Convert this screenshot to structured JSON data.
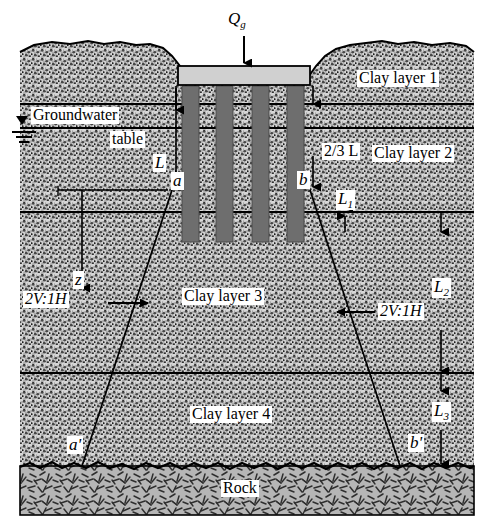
{
  "figure": {
    "width": 493,
    "height": 527
  },
  "colors": {
    "soil_fill": "#d6d6d6",
    "soil_stipple": "#1a1a1a",
    "rock_fill": "#b4b4b4",
    "rock_hatch": "#333333",
    "pile_fill": "#6e6e6e",
    "pile_cap_fill": "#d0d0d0",
    "line": "#000000",
    "label_bg": "#ffffff"
  },
  "load": {
    "symbol": "Q",
    "subscript": "g",
    "arrow": "down-arrow-icon"
  },
  "layers": [
    {
      "id": "clay1",
      "label": "Clay layer 1"
    },
    {
      "id": "clay2",
      "label": "Clay layer 2"
    },
    {
      "id": "clay3",
      "label": "Clay layer 3"
    },
    {
      "id": "clay4",
      "label": "Clay layer 4"
    },
    {
      "id": "rock",
      "label": "Rock"
    }
  ],
  "annotations": {
    "groundwater": {
      "line1": "Groundwater",
      "line2": "table",
      "symbol": "water-table-triangle-icon"
    },
    "pile_length": {
      "symbol": "L"
    },
    "two_thirds_length": {
      "text": "2/3 L"
    },
    "depth_z": {
      "symbol": "z"
    },
    "sublayer_1": {
      "symbol": "L",
      "subscript": "1"
    },
    "sublayer_2": {
      "symbol": "L",
      "subscript": "2"
    },
    "sublayer_3": {
      "symbol": "L",
      "subscript": "3"
    },
    "spread_left": {
      "text": "2V:1H"
    },
    "spread_right": {
      "text": "2V:1H"
    },
    "point_a": {
      "text": "a"
    },
    "point_b": {
      "text": "b"
    },
    "point_a_prime": {
      "text": "a'"
    },
    "point_b_prime": {
      "text": "b'"
    }
  }
}
